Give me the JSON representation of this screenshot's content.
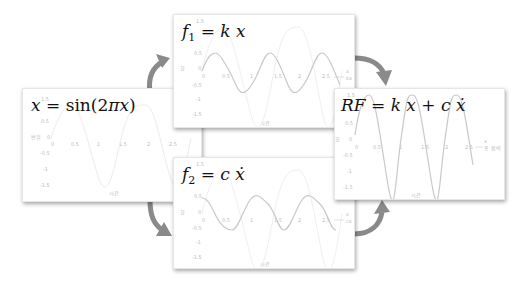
{
  "panels": {
    "input": {
      "equation": "x = sin(2πx)",
      "eq_parts": [
        "x",
        " = ",
        "sin(2",
        "π",
        "x",
        ")"
      ],
      "y_label": "변위",
      "x_label": "시간",
      "y_ticks": [
        "1.5",
        "1",
        "0.5",
        "0",
        "-0.5",
        "-1",
        "-1.5"
      ],
      "x_ticks": [
        "0",
        "0.5",
        "1",
        "1.5",
        "2",
        "2.5"
      ]
    },
    "spring": {
      "equation": "f1 = k x",
      "eq_lhs": "f",
      "eq_sub": "1",
      "eq_rhs": " = k x",
      "y_label": "힘",
      "x_label": "시간",
      "legend": [
        "x",
        "kx"
      ],
      "y_ticks": [
        "1.5",
        "1",
        "0.5",
        "0",
        "-0.5",
        "-1",
        "-1.5"
      ],
      "x_ticks": [
        "0",
        "0.5",
        "1",
        "1.5",
        "2",
        "2.5"
      ]
    },
    "damper": {
      "equation": "f2 = c ẋ",
      "eq_lhs": "f",
      "eq_sub": "2",
      "eq_rhs": " = c ẋ",
      "y_label": "힘",
      "x_label": "시간",
      "legend": [
        "x",
        "cẋ"
      ],
      "y_ticks": [
        "1.5",
        "1",
        "0.5",
        "0",
        "-0.5",
        "-1",
        "-1.5"
      ],
      "x_ticks": [
        "0",
        "0.5",
        "1",
        "1.5",
        "2",
        "2.5"
      ]
    },
    "result": {
      "equation": "RF = k x + c ẋ",
      "y_label": "힘",
      "x_label": "시간",
      "legend": [
        "x",
        "총 합력"
      ],
      "y_ticks": [
        "1.5",
        "1",
        "0.5",
        "0",
        "-0.5",
        "-1",
        "-1.5"
      ],
      "x_ticks": [
        "0",
        "0.5",
        "1",
        "1.5",
        "2",
        "2.5"
      ]
    }
  },
  "colors": {
    "curve_dark": "#c8c8c8",
    "curve_light": "#ececec",
    "arrow": "#8a8a8a",
    "panel_border": "#e6e6e6"
  }
}
